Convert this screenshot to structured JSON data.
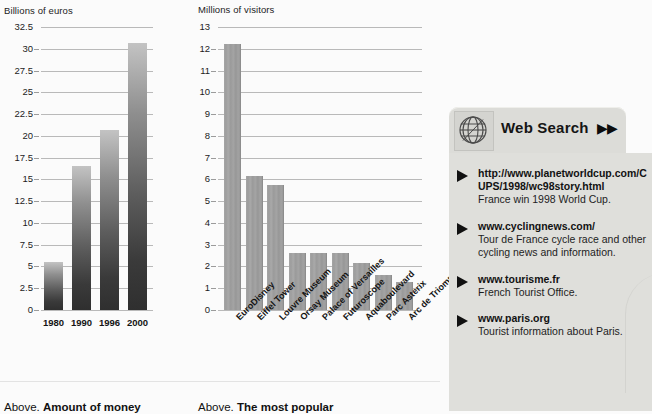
{
  "chart_data": [
    {
      "type": "bar",
      "title": "",
      "ylabel": "Billions of euros",
      "xlabel": "",
      "categories": [
        "1980",
        "1990",
        "1996",
        "2000"
      ],
      "values": [
        5.5,
        16.5,
        20.7,
        30.7
      ],
      "ylim": [
        0,
        32.5
      ],
      "yticks": [
        "32.5",
        "30",
        "27.5",
        "25",
        "22.5",
        "20",
        "17.5",
        "15",
        "12.5",
        "10",
        "7.5",
        "5",
        "2.5",
        "0"
      ],
      "ytick_values": [
        32.5,
        30,
        27.5,
        25,
        22.5,
        20,
        17.5,
        15,
        12.5,
        10,
        7.5,
        5,
        2.5,
        0
      ],
      "grid": true,
      "legend": "none",
      "caption_lead": "Above.",
      "caption_strong": "Amount of money"
    },
    {
      "type": "bar",
      "title": "",
      "ylabel": "Millions of visitors",
      "xlabel": "",
      "categories": [
        "EuroDisney",
        "Eiffel Tower",
        "Louvre Museum",
        "Orsay Museum",
        "Palace of Versailles",
        "Futuroscope",
        "Aquaboulevard",
        "Parc Asterix",
        "Arc de Triomphe"
      ],
      "values": [
        12.2,
        6.15,
        5.75,
        2.6,
        2.6,
        2.6,
        2.15,
        1.6,
        1.3
      ],
      "ylim": [
        0,
        13
      ],
      "yticks": [
        "13",
        "12",
        "11",
        "10",
        "9",
        "8",
        "7",
        "6",
        "5",
        "4",
        "3",
        "2",
        "1",
        "0"
      ],
      "ytick_values": [
        13,
        12,
        11,
        10,
        9,
        8,
        7,
        6,
        5,
        4,
        3,
        2,
        1,
        0
      ],
      "grid": true,
      "legend": "none",
      "caption_lead": "Above.",
      "caption_strong": "The most popular"
    }
  ],
  "websearch": {
    "icon": "globe-icon",
    "title": "Web Search",
    "arrows": "▶▶",
    "results": [
      {
        "url": "http://www.planetworldcup.com/CUPS/1998/wc98story.html",
        "desc": "France win 1998 World Cup."
      },
      {
        "url": "www.cyclingnews.com/",
        "desc": "Tour de France cycle race and other cycling news and information."
      },
      {
        "url": "www.tourisme.fr",
        "desc": "French Tourist Office."
      },
      {
        "url": "www.paris.org",
        "desc": "Tourist information about Paris."
      }
    ]
  },
  "colors": {
    "page_background": "#fbfbfb",
    "gridline": "#b9b9b9",
    "bar_money_top": "#c3c3c3",
    "bar_money_bottom": "#2f2f2f",
    "bar_visitors": "#9a9a9a",
    "panel_tab": "#dcdcd8",
    "panel_body": "#dfdfdb",
    "text": "#141414"
  }
}
